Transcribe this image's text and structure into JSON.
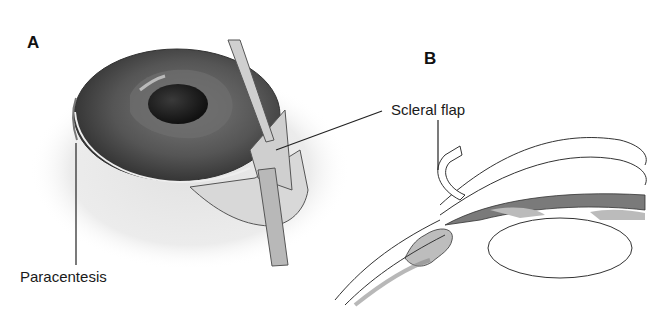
{
  "figure": {
    "panels": [
      {
        "id": "A",
        "label": "A",
        "description": "Perspective view of eye with scleral flap dissection and paracentesis"
      },
      {
        "id": "B",
        "label": "B",
        "description": "Cross-section of anterior segment showing scleral flap"
      }
    ],
    "callouts": {
      "paracentesis": "Paracentesis",
      "scleral_flap": "Scleral flap"
    },
    "colors": {
      "background": "#ffffff",
      "line": "#222222",
      "iris_dark": "#3a3a3a",
      "iris_mid": "#6a6a6a",
      "sclera_shade": "#e6e6e6",
      "tissue_gray": "#bdbdbd",
      "iris_section": "#7a7a7a"
    }
  }
}
